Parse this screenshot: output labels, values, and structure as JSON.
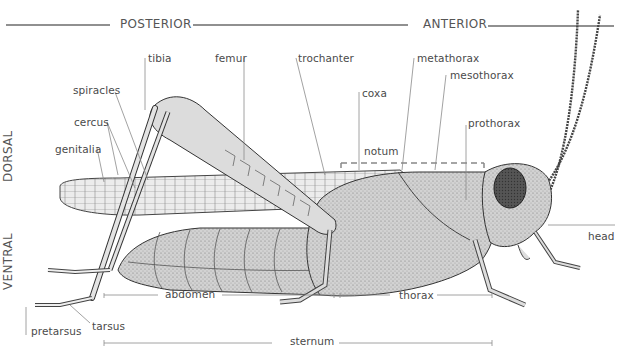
{
  "diagram": {
    "orientation": {
      "posterior": "POSTERIOR",
      "anterior": "ANTERIOR",
      "dorsal": "DORSAL",
      "ventral": "VENTRAL"
    },
    "labels": {
      "tibia": "tibia",
      "femur": "femur",
      "trochanter": "trochanter",
      "coxa": "coxa",
      "metathorax": "metathorax",
      "mesothorax": "mesothorax",
      "prothorax": "prothorax",
      "notum": "notum",
      "spiracles": "spiracles",
      "cercus": "cercus",
      "genitalia": "genitalia",
      "head": "head",
      "abdomen": "abdomen",
      "thorax": "thorax",
      "sternum": "sternum",
      "tarsus": "tarsus",
      "pretarsus": "pretarsus"
    },
    "colors": {
      "background": "#ffffff",
      "line": "#8a8a8a",
      "axis_line": "#222222",
      "notum_dash": "#888888",
      "body_fill": "#d9d9d9",
      "body_stroke": "#333333"
    }
  }
}
